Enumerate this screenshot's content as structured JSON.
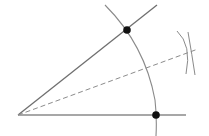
{
  "diagram": {
    "colors": {
      "ray": "#6f6f6f",
      "arc": "#8a8a8a",
      "bisector": "#8c8c8c",
      "point": "#111111",
      "background": "#ffffff"
    },
    "vertex": {
      "x": 18,
      "y": 115
    },
    "rays": [
      {
        "name": "upper-ray",
        "x2": 157,
        "y2": 5
      },
      {
        "name": "lower-ray",
        "x2": 186,
        "y2": 115
      }
    ],
    "intersection_points": [
      {
        "name": "upper-arc-point",
        "x": 127,
        "y": 30
      },
      {
        "name": "lower-arc-point",
        "x": 156,
        "y": 115
      }
    ],
    "bisector_end": {
      "x": 198,
      "y": 49
    }
  }
}
